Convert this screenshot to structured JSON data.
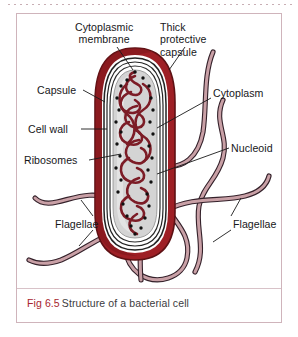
{
  "figure": {
    "caption_number": "Fig 6.5",
    "caption_text": "Structure of a bacterial cell",
    "frame_color": "#cfb4bb",
    "caption_number_color": "#a8252f",
    "caption_text_color": "#3b3b40"
  },
  "diagram": {
    "subject": "bacterial cell",
    "palette": {
      "capsule_outer": "#9e1f25",
      "capsule_dark": "#6d1418",
      "cell_wall_outline": "#2b2b2b",
      "cytoplasm_fill": "#d6d6d6",
      "nucleoid_strand": "#7c1c26",
      "ribosome_dot": "#111111",
      "flagella_fill": "#c59aa0",
      "flagella_outline": "#3a2329",
      "label_text": "#17171a",
      "leader_line": "#1a1a1a"
    },
    "labels": [
      {
        "id": "cytoplasmic-membrane",
        "text": "Cytoplasmic\nmembrane",
        "side": "top"
      },
      {
        "id": "thick-protective-capsule",
        "text": "Thick\nprotective\ncapsule",
        "side": "top"
      },
      {
        "id": "capsule",
        "text": "Capsule",
        "side": "left"
      },
      {
        "id": "cell-wall",
        "text": "Cell wall",
        "side": "left"
      },
      {
        "id": "ribosomes",
        "text": "Ribosomes",
        "side": "left"
      },
      {
        "id": "cytoplasm",
        "text": "Cytoplasm",
        "side": "right"
      },
      {
        "id": "nucleoid",
        "text": "Nucleoid",
        "side": "right"
      },
      {
        "id": "flagellae-left",
        "text": "Flagellae",
        "side": "bottom-left"
      },
      {
        "id": "flagellae-right",
        "text": "Flagellae",
        "side": "bottom-right"
      }
    ]
  }
}
